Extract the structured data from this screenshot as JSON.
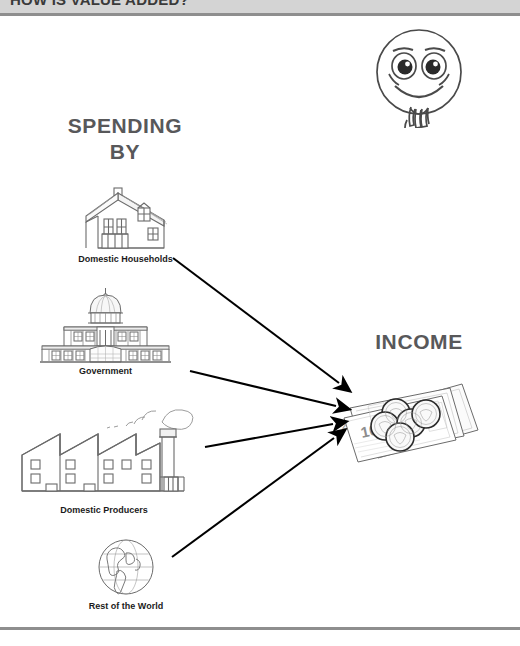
{
  "header": {
    "title": "HOW IS VALUE ADDED?",
    "band_color": "#d4d4d4",
    "rule_color": "#8e8e8e"
  },
  "diagram": {
    "type": "flow",
    "title": "HOW IS VALUE ADDED?",
    "left_heading": "SPENDING\nBY",
    "left_heading_line1": "SPENDING",
    "left_heading_line2": "BY",
    "right_heading": "INCOME",
    "thinking_face_icon": "thinking-face-icon",
    "sources": [
      {
        "label": "Domestic Households",
        "icon": "house-icon"
      },
      {
        "label": "Government",
        "icon": "capitol-building-icon"
      },
      {
        "label": "Domestic Producers",
        "icon": "factory-icon"
      },
      {
        "label": "Rest of the World",
        "icon": "globe-icon"
      }
    ],
    "target": {
      "label": "INCOME",
      "icon": "money-banknotes-coins-icon",
      "banknote_denomination": "10"
    },
    "arrows": [
      {
        "from": "Domestic Households",
        "to": "INCOME"
      },
      {
        "from": "Government",
        "to": "INCOME"
      },
      {
        "from": "Domestic Producers",
        "to": "INCOME"
      },
      {
        "from": "Rest of the World",
        "to": "INCOME"
      }
    ],
    "colors": {
      "heading": "#58585a",
      "caption": "#1b1b1b",
      "arrow": "#000000",
      "line_art": "#6b6b6b",
      "background": "#ffffff"
    }
  }
}
